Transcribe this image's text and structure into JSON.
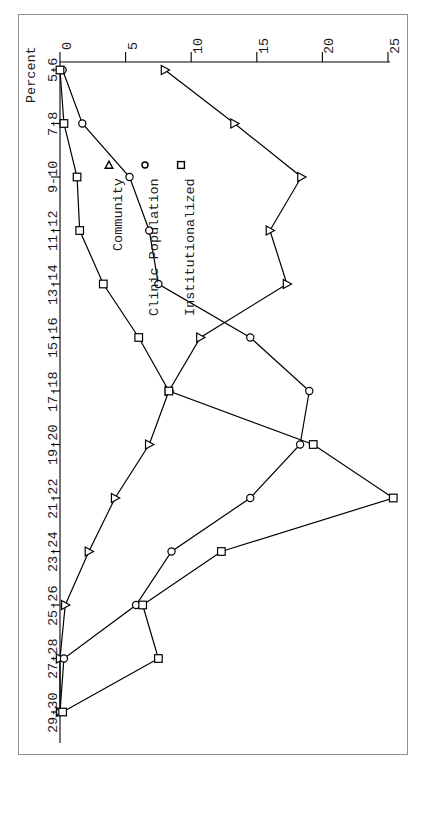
{
  "figure": {
    "value_axis_title": "Percent"
  },
  "legend": {
    "entries": [
      {
        "label": "Community",
        "marker": "triangle-marker"
      },
      {
        "label": "Clinic Population",
        "marker": "circle-marker"
      },
      {
        "label": "Institutionalized",
        "marker": "square-marker"
      }
    ]
  },
  "chart_data": {
    "type": "line",
    "title": "",
    "xlabel": "",
    "ylabel": "Percent",
    "orientation": "rotated-90-ccw",
    "grid": false,
    "legend_position": "top-left",
    "categories": [
      "5-6",
      "7-8",
      "9-10",
      "11-12",
      "13-14",
      "15-16",
      "17-18",
      "19-20",
      "21-22",
      "23-24",
      "25-26",
      "27-28",
      "29-30"
    ],
    "xticks": [
      "5-6",
      "7-8",
      "9-10",
      "11-12",
      "13-14",
      "15-16",
      "17-18",
      "19-20",
      "21-22",
      "23-24",
      "25-26",
      "27-28",
      "29-30"
    ],
    "yticks": [
      0,
      5,
      10,
      15,
      20,
      25
    ],
    "ylim": [
      0,
      27
    ],
    "series": [
      {
        "name": "Community",
        "marker": "triangle",
        "values": [
          8.0,
          13.3,
          18.4,
          16.0,
          17.3,
          10.7,
          8.3,
          6.8,
          4.2,
          2.2,
          0.4,
          0.0,
          0.0
        ]
      },
      {
        "name": "Clinic Population",
        "marker": "circle",
        "values": [
          0.2,
          1.7,
          5.3,
          6.8,
          7.5,
          14.5,
          19.0,
          18.3,
          14.5,
          8.5,
          5.8,
          0.3,
          0.0
        ]
      },
      {
        "name": "Institutionalized",
        "marker": "square",
        "values": [
          0.0,
          0.3,
          1.3,
          1.5,
          3.3,
          6.0,
          8.3,
          19.3,
          25.4,
          12.3,
          6.3,
          7.5,
          0.2
        ]
      }
    ]
  },
  "colors": {
    "ink": "#000000",
    "frame": "#8f8f8f",
    "background": "#ffffff"
  }
}
